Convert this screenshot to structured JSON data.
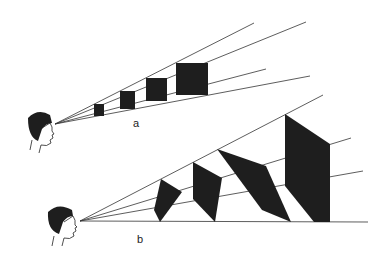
{
  "diagram": {
    "panels": [
      {
        "label": "a",
        "description": "Frontal squares receding along converging lines of sight"
      },
      {
        "label": "b",
        "description": "Slanted quadrilaterals on a ground line, lines of sight from eye"
      }
    ],
    "colors": {
      "shape_fill": "#1e1e1e",
      "line": "#333333",
      "background": "#ffffff"
    }
  }
}
